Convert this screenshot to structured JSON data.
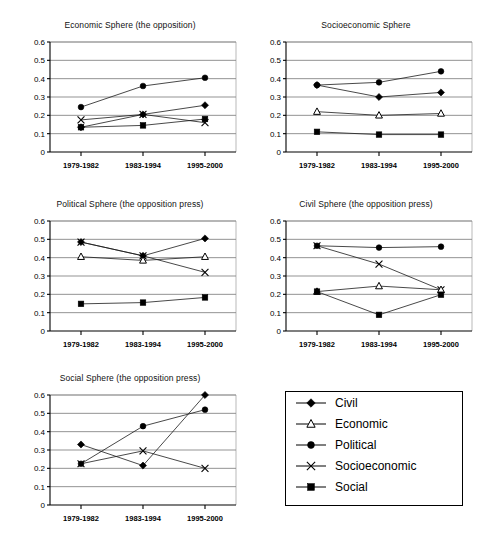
{
  "chart_data": [
    {
      "type": "line",
      "title": "Economic Sphere (the opposition)",
      "xlabel": "",
      "ylabel": "",
      "ylim": [
        0,
        0.6
      ],
      "yticks": [
        0,
        0.1,
        0.2,
        0.3,
        0.4,
        0.5,
        0.6
      ],
      "ytick_labels": [
        "0",
        "0.1",
        "0.2",
        "0.3",
        "0.4",
        "0.5",
        "0.6"
      ],
      "grid": true,
      "legend": "external-shared",
      "categories": [
        "1979-1982",
        "1983-1994",
        "1995-2000"
      ],
      "series": [
        {
          "name": "Civil",
          "marker": "diamond",
          "values": [
            0.135,
            0.205,
            0.255
          ]
        },
        {
          "name": "Political",
          "marker": "circle",
          "values": [
            0.245,
            0.36,
            0.405
          ]
        },
        {
          "name": "Socioeconomic",
          "marker": "x",
          "values": [
            0.175,
            0.205,
            0.16
          ]
        },
        {
          "name": "Social",
          "marker": "square",
          "values": [
            0.135,
            0.145,
            0.18
          ]
        }
      ]
    },
    {
      "type": "line",
      "title": "Socioeconomic Sphere",
      "xlabel": "",
      "ylabel": "",
      "ylim": [
        0,
        0.6
      ],
      "yticks": [
        0,
        0.1,
        0.2,
        0.3,
        0.4,
        0.5,
        0.6
      ],
      "ytick_labels": [
        "0",
        "0.1",
        "0.2",
        "0.3",
        "0.4",
        "0.5",
        "0.6"
      ],
      "grid": true,
      "legend": "external-shared",
      "categories": [
        "1979-1982",
        "1983-1994",
        "1995-2000"
      ],
      "series": [
        {
          "name": "Civil",
          "marker": "diamond",
          "values": [
            0.365,
            0.3,
            0.325
          ]
        },
        {
          "name": "Economic",
          "marker": "triangle",
          "values": [
            0.22,
            0.2,
            0.21
          ]
        },
        {
          "name": "Political",
          "marker": "circle",
          "values": [
            0.365,
            0.38,
            0.44
          ]
        },
        {
          "name": "Social",
          "marker": "square",
          "values": [
            0.11,
            0.095,
            0.095
          ]
        }
      ]
    },
    {
      "type": "line",
      "title": "Political Sphere (the opposition press)",
      "xlabel": "",
      "ylabel": "",
      "ylim": [
        0,
        0.6
      ],
      "yticks": [
        0,
        0.1,
        0.2,
        0.3,
        0.4,
        0.5,
        0.6
      ],
      "ytick_labels": [
        "0",
        "0.1",
        "0.2",
        "0.3",
        "0.4",
        "0.5",
        "0.6"
      ],
      "grid": true,
      "legend": "external-shared",
      "categories": [
        "1979-1982",
        "1983-1994",
        "1995-2000"
      ],
      "series": [
        {
          "name": "Civil",
          "marker": "diamond",
          "values": [
            0.485,
            0.41,
            0.505
          ]
        },
        {
          "name": "Economic",
          "marker": "triangle",
          "values": [
            0.405,
            0.385,
            0.405
          ]
        },
        {
          "name": "Socioeconomic",
          "marker": "x",
          "values": [
            0.485,
            0.41,
            0.32
          ]
        },
        {
          "name": "Social",
          "marker": "square",
          "values": [
            0.148,
            0.155,
            0.183
          ]
        }
      ]
    },
    {
      "type": "line",
      "title": "Civil Sphere (the opposition press)",
      "xlabel": "",
      "ylabel": "",
      "ylim": [
        0,
        0.6
      ],
      "yticks": [
        0,
        0.1,
        0.2,
        0.3,
        0.4,
        0.5,
        0.6
      ],
      "ytick_labels": [
        "0",
        "0.1",
        "0.2",
        "0.3",
        "0.4",
        "0.5",
        "0.6"
      ],
      "grid": true,
      "legend": "external-shared",
      "categories": [
        "1979-1982",
        "1983-1994",
        "1995-2000"
      ],
      "series": [
        {
          "name": "Political",
          "marker": "circle",
          "values": [
            0.465,
            0.455,
            0.46
          ]
        },
        {
          "name": "Socioeconomic",
          "marker": "x",
          "values": [
            0.465,
            0.365,
            0.225
          ]
        },
        {
          "name": "Economic",
          "marker": "triangle",
          "values": [
            0.215,
            0.245,
            0.225
          ]
        },
        {
          "name": "Social",
          "marker": "square",
          "values": [
            0.215,
            0.088,
            0.198
          ]
        }
      ]
    },
    {
      "type": "line",
      "title": "Social Sphere (the opposition press)",
      "xlabel": "",
      "ylabel": "",
      "ylim": [
        0,
        0.6
      ],
      "yticks": [
        0,
        0.1,
        0.2,
        0.3,
        0.4,
        0.5,
        0.6
      ],
      "ytick_labels": [
        "0",
        "0.1",
        "0.2",
        "0.3",
        "0.4",
        "0.5",
        "0.6"
      ],
      "grid": true,
      "legend": "external-shared",
      "categories": [
        "1979-1982",
        "1983-1994",
        "1995-2000"
      ],
      "series": [
        {
          "name": "Civil",
          "marker": "diamond",
          "values": [
            0.33,
            0.215,
            0.6
          ]
        },
        {
          "name": "Political",
          "marker": "circle",
          "values": [
            0.225,
            0.43,
            0.52
          ]
        },
        {
          "name": "Socioeconomic",
          "marker": "x",
          "values": [
            0.225,
            0.295,
            0.2
          ]
        }
      ]
    }
  ],
  "legend": {
    "items": [
      {
        "label": "Civil",
        "marker": "diamond"
      },
      {
        "label": "Economic",
        "marker": "triangle"
      },
      {
        "label": "Political",
        "marker": "circle"
      },
      {
        "label": "Socioeconomic",
        "marker": "x"
      },
      {
        "label": "Social",
        "marker": "square"
      }
    ]
  }
}
